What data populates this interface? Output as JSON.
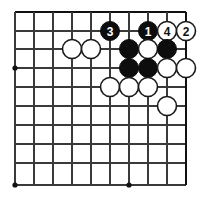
{
  "figure": {
    "board_colors": {
      "background": "#ffffff",
      "line": "#3a3a3a",
      "edge_line": "#111111",
      "black_stone": "#0d0d0d",
      "white_stone": "#ffffff",
      "stone_outline": "#1a1a1a",
      "black_label": "#ffffff",
      "white_label": "#111111"
    },
    "grid": {
      "x_positions": [
        15,
        34,
        53,
        72,
        91,
        110,
        129,
        148,
        167,
        186
      ],
      "y_positions": [
        12,
        31,
        49,
        68,
        87,
        106,
        125,
        144,
        163,
        185
      ],
      "edge_top_y": 12,
      "edge_right_x": 186,
      "spacing": 19,
      "stone_radius": 9.5
    },
    "star_points": [
      {
        "cx": 15,
        "cy": 68
      },
      {
        "cx": 15,
        "cy": 185
      },
      {
        "cx": 129,
        "cy": 185
      }
    ],
    "stones": [
      {
        "id": "black-move-3",
        "color": "black",
        "label": "3",
        "cx": 110,
        "cy": 31
      },
      {
        "id": "black-move-1",
        "color": "black",
        "label": "1",
        "cx": 148,
        "cy": 31
      },
      {
        "id": "white-move-4",
        "color": "white",
        "label": "4",
        "cx": 167,
        "cy": 31
      },
      {
        "id": "white-move-2",
        "color": "white",
        "label": "2",
        "cx": 186,
        "cy": 31
      },
      {
        "id": "black-stone-a",
        "color": "black",
        "label": "",
        "cx": 129,
        "cy": 49
      },
      {
        "id": "white-stone-a",
        "color": "white",
        "label": "",
        "cx": 148,
        "cy": 49
      },
      {
        "id": "black-stone-b",
        "color": "black",
        "label": "",
        "cx": 167,
        "cy": 49
      },
      {
        "id": "white-stone-b",
        "color": "white",
        "label": "",
        "cx": 72,
        "cy": 49
      },
      {
        "id": "white-stone-c",
        "color": "white",
        "label": "",
        "cx": 91,
        "cy": 49
      },
      {
        "id": "black-stone-c",
        "color": "black",
        "label": "",
        "cx": 129,
        "cy": 68
      },
      {
        "id": "black-stone-d",
        "color": "black",
        "label": "",
        "cx": 148,
        "cy": 68
      },
      {
        "id": "white-stone-d",
        "color": "white",
        "label": "",
        "cx": 167,
        "cy": 68
      },
      {
        "id": "white-stone-e",
        "color": "white",
        "label": "",
        "cx": 186,
        "cy": 68
      },
      {
        "id": "white-stone-f",
        "color": "white",
        "label": "",
        "cx": 110,
        "cy": 87
      },
      {
        "id": "white-stone-g",
        "color": "white",
        "label": "",
        "cx": 129,
        "cy": 87
      },
      {
        "id": "white-stone-h",
        "color": "white",
        "label": "",
        "cx": 148,
        "cy": 87
      },
      {
        "id": "white-stone-i",
        "color": "white",
        "label": "",
        "cx": 167,
        "cy": 106
      }
    ],
    "move_sequence": [
      {
        "number": "1",
        "color": "black"
      },
      {
        "number": "2",
        "color": "white"
      },
      {
        "number": "3",
        "color": "black"
      },
      {
        "number": "4",
        "color": "white"
      }
    ]
  }
}
